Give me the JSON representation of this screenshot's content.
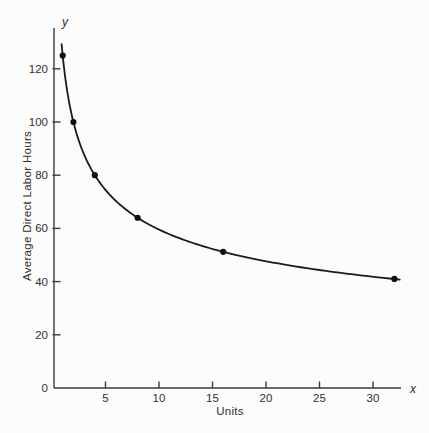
{
  "chart_data": {
    "type": "line",
    "title": "",
    "xlabel": "Units",
    "ylabel": "Average Direct Labor Hours",
    "x_axis_end_label": "x",
    "y_axis_end_label": "y",
    "x_ticks": [
      5,
      10,
      15,
      20,
      25,
      30
    ],
    "y_ticks": [
      0,
      20,
      40,
      60,
      80,
      100,
      120
    ],
    "xlim": [
      0,
      32.5
    ],
    "ylim": [
      0,
      135
    ],
    "grid": false,
    "legend_position": "none",
    "points": [
      {
        "x": 1,
        "y": 125
      },
      {
        "x": 2,
        "y": 100
      },
      {
        "x": 4,
        "y": 80
      },
      {
        "x": 8,
        "y": 64
      },
      {
        "x": 16,
        "y": 51.2
      },
      {
        "x": 32,
        "y": 41
      }
    ],
    "curve": {
      "model": "80% learning curve",
      "formula": "y = 125 * x^(log2(0.8))",
      "a": 125,
      "b": -0.321928,
      "x_start": 0.9,
      "x_end": 32.5
    },
    "colors": {
      "curve": "#1b1b1b",
      "points": "#111111",
      "axis": "#3a3a3a",
      "text": "#2f2f2f",
      "background": "#fcfcfc"
    }
  }
}
